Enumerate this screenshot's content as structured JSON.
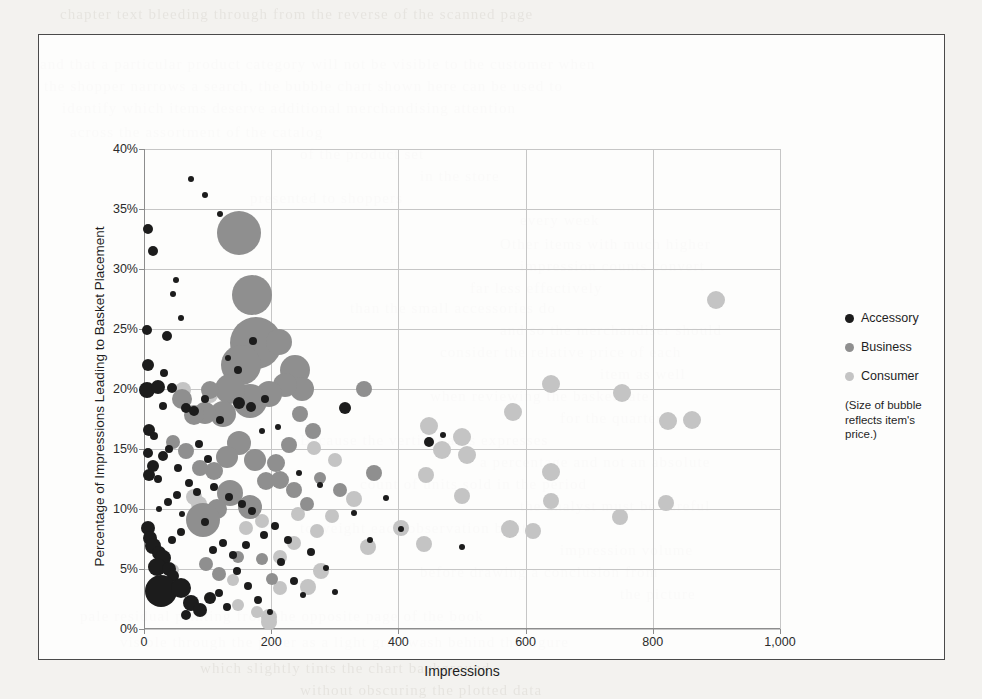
{
  "chart_data": {
    "type": "scatter",
    "title": "",
    "xlabel": "Impressions",
    "ylabel": "Percentage of Impressions Leading to Basket Placement",
    "xlim": [
      0,
      1000
    ],
    "ylim": [
      0,
      0.4
    ],
    "x_ticks": [
      "0",
      "200",
      "400",
      "600",
      "800",
      "1,000"
    ],
    "x_tick_values": [
      0,
      200,
      400,
      600,
      800,
      1000
    ],
    "y_ticks": [
      "0%",
      "5%",
      "10%",
      "15%",
      "20%",
      "25%",
      "30%",
      "35%",
      "40%"
    ],
    "y_tick_values": [
      0,
      5,
      10,
      15,
      20,
      25,
      30,
      35,
      40
    ],
    "grid": true,
    "legend_position": "right-outside",
    "size_encoding": "bubble area reflects item price",
    "series": [
      {
        "name": "Accessory",
        "color": "#1c1c1c",
        "points": [
          [
            6,
            33.3,
            5
          ],
          [
            14,
            31.5,
            5
          ],
          [
            4,
            24.9,
            5
          ],
          [
            6,
            22.0,
            6
          ],
          [
            4,
            19.9,
            8
          ],
          [
            36,
            24.4,
            5
          ],
          [
            50,
            29.1,
            3
          ],
          [
            46,
            27.9,
            3
          ],
          [
            74,
            37.5,
            3
          ],
          [
            96,
            36.2,
            3
          ],
          [
            120,
            34.6,
            3
          ],
          [
            58,
            25.9,
            3
          ],
          [
            8,
            16.6,
            6
          ],
          [
            16,
            16.1,
            4
          ],
          [
            6,
            14.7,
            5
          ],
          [
            30,
            14.4,
            5
          ],
          [
            14,
            13.6,
            6
          ],
          [
            8,
            12.8,
            6
          ],
          [
            22,
            12.5,
            4
          ],
          [
            40,
            15.0,
            4
          ],
          [
            54,
            13.4,
            4
          ],
          [
            30,
            18.6,
            4
          ],
          [
            66,
            18.4,
            5
          ],
          [
            78,
            18.2,
            5
          ],
          [
            96,
            19.2,
            4
          ],
          [
            120,
            17.4,
            4
          ],
          [
            150,
            18.8,
            6
          ],
          [
            168,
            18.5,
            5
          ],
          [
            190,
            19.2,
            4
          ],
          [
            148,
            21.6,
            4
          ],
          [
            186,
            16.5,
            3
          ],
          [
            210,
            16.8,
            3
          ],
          [
            110,
            11.8,
            4
          ],
          [
            134,
            11.0,
            4
          ],
          [
            154,
            10.4,
            4
          ],
          [
            170,
            9.8,
            4
          ],
          [
            96,
            8.9,
            4
          ],
          [
            60,
            9.6,
            3
          ],
          [
            6,
            8.4,
            7
          ],
          [
            10,
            7.6,
            7
          ],
          [
            14,
            6.9,
            8
          ],
          [
            24,
            6.3,
            7
          ],
          [
            30,
            5.9,
            8
          ],
          [
            20,
            5.2,
            9
          ],
          [
            40,
            5.0,
            7
          ],
          [
            46,
            4.4,
            6
          ],
          [
            26,
            3.2,
            16
          ],
          [
            58,
            3.4,
            10
          ],
          [
            74,
            2.2,
            8
          ],
          [
            88,
            1.6,
            7
          ],
          [
            104,
            2.6,
            6
          ],
          [
            66,
            1.2,
            5
          ],
          [
            118,
            3.0,
            4
          ],
          [
            130,
            1.8,
            4
          ],
          [
            146,
            4.8,
            4
          ],
          [
            164,
            3.6,
            4
          ],
          [
            180,
            2.4,
            4
          ],
          [
            198,
            1.4,
            3
          ],
          [
            216,
            5.6,
            4
          ],
          [
            236,
            4.0,
            4
          ],
          [
            250,
            2.8,
            3
          ],
          [
            262,
            6.4,
            4
          ],
          [
            286,
            5.1,
            3
          ],
          [
            300,
            3.1,
            3
          ],
          [
            316,
            18.4,
            6
          ],
          [
            330,
            9.7,
            3
          ],
          [
            356,
            7.4,
            3
          ],
          [
            380,
            10.9,
            3
          ],
          [
            404,
            8.3,
            3
          ],
          [
            448,
            15.6,
            5
          ],
          [
            470,
            16.2,
            3
          ],
          [
            226,
            7.4,
            4
          ],
          [
            206,
            8.6,
            4
          ],
          [
            188,
            7.8,
            4
          ],
          [
            160,
            7.0,
            4
          ],
          [
            140,
            6.2,
            4
          ],
          [
            124,
            7.2,
            4
          ],
          [
            108,
            6.6,
            4
          ],
          [
            84,
            11.4,
            4
          ],
          [
            70,
            12.2,
            4
          ],
          [
            52,
            11.2,
            4
          ],
          [
            38,
            10.6,
            4
          ],
          [
            24,
            10.0,
            3
          ],
          [
            44,
            20.1,
            5
          ],
          [
            22,
            20.2,
            7
          ],
          [
            32,
            21.3,
            4
          ],
          [
            172,
            24.0,
            4
          ],
          [
            132,
            22.6,
            3
          ],
          [
            86,
            15.4,
            4
          ],
          [
            100,
            14.2,
            4
          ],
          [
            58,
            8.1,
            4
          ],
          [
            44,
            7.4,
            4
          ],
          [
            500,
            6.8,
            3
          ],
          [
            276,
            12.0,
            3
          ],
          [
            244,
            13.0,
            3
          ]
        ]
      },
      {
        "name": "Business",
        "color": "#8f8f8f",
        "points": [
          [
            150,
            33.0,
            22
          ],
          [
            170,
            27.8,
            20
          ],
          [
            176,
            23.8,
            26
          ],
          [
            152,
            22.0,
            20
          ],
          [
            212,
            23.9,
            13
          ],
          [
            238,
            21.6,
            15
          ],
          [
            248,
            20.0,
            12
          ],
          [
            222,
            20.3,
            12
          ],
          [
            196,
            19.6,
            13
          ],
          [
            166,
            19.0,
            17
          ],
          [
            136,
            20.0,
            15
          ],
          [
            104,
            19.9,
            9
          ],
          [
            124,
            17.9,
            13
          ],
          [
            96,
            18.0,
            11
          ],
          [
            60,
            19.2,
            10
          ],
          [
            78,
            17.8,
            10
          ],
          [
            246,
            17.9,
            8
          ],
          [
            266,
            16.5,
            8
          ],
          [
            228,
            15.3,
            8
          ],
          [
            208,
            13.8,
            9
          ],
          [
            192,
            12.3,
            9
          ],
          [
            174,
            14.1,
            11
          ],
          [
            150,
            15.5,
            12
          ],
          [
            130,
            14.3,
            11
          ],
          [
            110,
            13.2,
            9
          ],
          [
            88,
            13.4,
            8
          ],
          [
            66,
            14.8,
            8
          ],
          [
            46,
            15.6,
            7
          ],
          [
            136,
            11.3,
            13
          ],
          [
            166,
            10.2,
            12
          ],
          [
            114,
            10.0,
            10
          ],
          [
            92,
            9.1,
            17
          ],
          [
            214,
            12.4,
            9
          ],
          [
            236,
            11.6,
            8
          ],
          [
            256,
            10.4,
            7
          ],
          [
            276,
            12.6,
            6
          ],
          [
            118,
            4.6,
            7
          ],
          [
            98,
            5.4,
            7
          ],
          [
            148,
            6.0,
            6
          ],
          [
            186,
            5.8,
            6
          ],
          [
            22,
            3.6,
            8
          ],
          [
            202,
            4.2,
            6
          ],
          [
            346,
            20.0,
            8
          ],
          [
            362,
            13.0,
            8
          ],
          [
            308,
            11.6,
            7
          ]
        ]
      },
      {
        "name": "Consumer",
        "color": "#c4c4c4",
        "points": [
          [
            900,
            27.4,
            9
          ],
          [
            640,
            20.4,
            9
          ],
          [
            752,
            19.7,
            9
          ],
          [
            824,
            17.3,
            9
          ],
          [
            862,
            17.4,
            9
          ],
          [
            580,
            18.1,
            9
          ],
          [
            500,
            16.0,
            9
          ],
          [
            448,
            16.9,
            9
          ],
          [
            468,
            14.9,
            9
          ],
          [
            508,
            14.5,
            9
          ],
          [
            640,
            13.1,
            9
          ],
          [
            444,
            12.8,
            8
          ],
          [
            500,
            11.1,
            8
          ],
          [
            640,
            10.7,
            8
          ],
          [
            820,
            10.5,
            8
          ],
          [
            748,
            9.3,
            8
          ],
          [
            576,
            8.3,
            9
          ],
          [
            612,
            8.2,
            8
          ],
          [
            440,
            7.1,
            8
          ],
          [
            404,
            8.4,
            8
          ],
          [
            352,
            6.8,
            8
          ],
          [
            330,
            10.8,
            8
          ],
          [
            278,
            4.8,
            8
          ],
          [
            258,
            3.5,
            8
          ],
          [
            214,
            3.4,
            7
          ],
          [
            196,
            1.0,
            8
          ],
          [
            196,
            0.6,
            8
          ],
          [
            86,
            10.4,
            8
          ],
          [
            78,
            11.0,
            8
          ],
          [
            62,
            19.9,
            8
          ],
          [
            104,
            19.5,
            8
          ],
          [
            46,
            4.9,
            6
          ],
          [
            36,
            3.1,
            7
          ],
          [
            214,
            6.0,
            7
          ],
          [
            236,
            7.2,
            7
          ],
          [
            272,
            8.2,
            7
          ],
          [
            296,
            9.4,
            7
          ],
          [
            242,
            9.6,
            7
          ],
          [
            148,
            2.0,
            6
          ],
          [
            178,
            1.4,
            6
          ],
          [
            268,
            15.1,
            7
          ],
          [
            300,
            14.1,
            7
          ],
          [
            160,
            8.4,
            7
          ],
          [
            186,
            9.0,
            7
          ],
          [
            140,
            4.1,
            6
          ]
        ]
      }
    ],
    "legend": [
      {
        "label": "Accessory",
        "color": "#1c1c1c"
      },
      {
        "label": "Business",
        "color": "#8f8f8f"
      },
      {
        "label": "Consumer",
        "color": "#c4c4c4"
      }
    ],
    "annotation": "(Size of bubble\nreflects item's\nprice.)"
  },
  "ghost_text": [
    {
      "x": 60,
      "y": 6,
      "text": "chapter text bleeding through from the reverse of the scanned page"
    },
    {
      "x": 40,
      "y": 56,
      "text": "and that a particular product category will not be visible to the customer when"
    },
    {
      "x": 44,
      "y": 78,
      "text": "the shopper narrows a search, the bubble chart shown here can be used to"
    },
    {
      "x": 62,
      "y": 100,
      "text": "identify which items deserve additional merchandising attention"
    },
    {
      "x": 70,
      "y": 124,
      "text": "across the assortment of the catalog"
    },
    {
      "x": 300,
      "y": 146,
      "text": "of the product set"
    },
    {
      "x": 420,
      "y": 168,
      "text": "in the store"
    },
    {
      "x": 250,
      "y": 190,
      "text": "presented to shoppers"
    },
    {
      "x": 520,
      "y": 212,
      "text": "every week"
    },
    {
      "x": 500,
      "y": 236,
      "text": "Other items with much higher"
    },
    {
      "x": 520,
      "y": 258,
      "text": "impression counts convert"
    },
    {
      "x": 470,
      "y": 280,
      "text": "far less effectively"
    },
    {
      "x": 350,
      "y": 300,
      "text": "than the small accessories do"
    },
    {
      "x": 500,
      "y": 322,
      "text": "and so the merchandiser should"
    },
    {
      "x": 440,
      "y": 344,
      "text": "consider the relative price of each"
    },
    {
      "x": 600,
      "y": 366,
      "text": "item as well"
    },
    {
      "x": 430,
      "y": 388,
      "text": "when reviewing the basket rate"
    },
    {
      "x": 560,
      "y": 410,
      "text": "for the quarter"
    },
    {
      "x": 300,
      "y": 432,
      "text": "Because the vertical axis expresses"
    },
    {
      "x": 480,
      "y": 454,
      "text": "a percentage and not an absolute"
    },
    {
      "x": 360,
      "y": 476,
      "text": "count of units sold in the period"
    },
    {
      "x": 520,
      "y": 498,
      "text": "the analyst must be careful"
    },
    {
      "x": 300,
      "y": 520,
      "text": "to weight each observation by its"
    },
    {
      "x": 560,
      "y": 542,
      "text": "impression volume"
    },
    {
      "x": 420,
      "y": 564,
      "text": "before drawing a conclusion from"
    },
    {
      "x": 620,
      "y": 586,
      "text": "the picture"
    },
    {
      "x": 80,
      "y": 608,
      "text": "pale residual printing from the opposite page of the book"
    },
    {
      "x": 120,
      "y": 634,
      "text": "visible through the paper as a light gray wash behind the figure"
    },
    {
      "x": 200,
      "y": 660,
      "text": "which slightly tints the chart background"
    },
    {
      "x": 300,
      "y": 682,
      "text": "without obscuring the plotted data"
    }
  ]
}
